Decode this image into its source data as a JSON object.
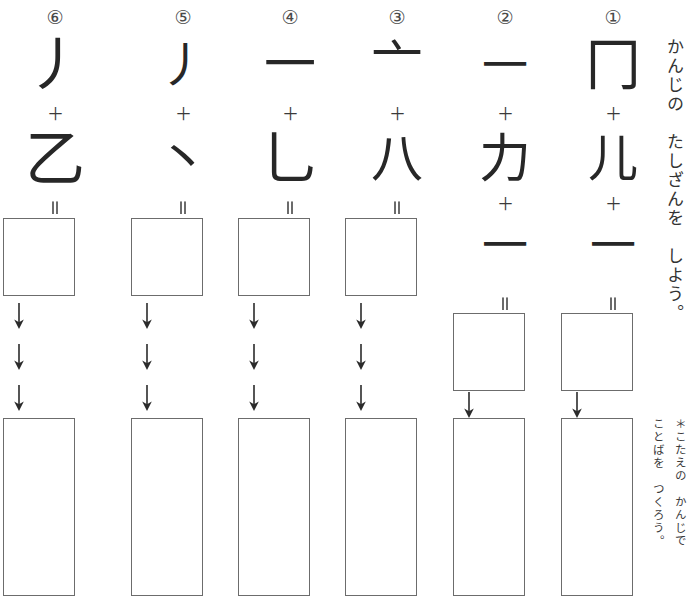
{
  "page": {
    "kind": "kanji-addition-worksheet",
    "background_color": "#ffffff",
    "ink_color": "#272727",
    "box_border_color": "#6c6c6c",
    "title_vertical": "かんじの　たしざんを　しよう。",
    "note_line_1": "＊こたえの　かんじで",
    "note_line_2": "ことばを　つくろう。",
    "plus_sign": "＋",
    "equals_sign": "＝",
    "arrow_glyph": "↓"
  },
  "columns": [
    {
      "number_label": "⑥",
      "terms": [
        "丿",
        "乙"
      ],
      "term_sizes": [
        58,
        60
      ],
      "operators": [
        "＋"
      ],
      "answer_box": true,
      "arrow_count": 3,
      "word_box": true
    },
    {
      "number_label": "⑤",
      "terms": [
        "丿",
        "丶"
      ],
      "term_sizes": [
        48,
        52
      ],
      "operators": [
        "＋"
      ],
      "answer_box": true,
      "arrow_count": 3,
      "word_box": true
    },
    {
      "number_label": "④",
      "terms": [
        "一",
        "乚"
      ],
      "term_sizes": [
        52,
        58
      ],
      "operators": [
        "＋"
      ],
      "answer_box": true,
      "arrow_count": 3,
      "word_box": true
    },
    {
      "number_label": "③",
      "terms": [
        "亠",
        "八"
      ],
      "term_sizes": [
        52,
        52
      ],
      "operators": [
        "＋"
      ],
      "answer_box": true,
      "arrow_count": 3,
      "word_box": true
    },
    {
      "number_label": "②",
      "terms": [
        "一",
        "力",
        "一"
      ],
      "term_sizes": [
        46,
        52,
        46
      ],
      "operators": [
        "＋",
        "＋"
      ],
      "answer_box": true,
      "arrow_count": 1,
      "word_box": true
    },
    {
      "number_label": "①",
      "terms": [
        "冂",
        "儿",
        "一"
      ],
      "term_sizes": [
        56,
        50,
        46
      ],
      "operators": [
        "＋",
        "＋"
      ],
      "answer_box": true,
      "arrow_count": 1,
      "word_box": true
    }
  ]
}
